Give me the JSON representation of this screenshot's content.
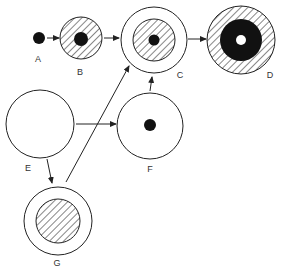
{
  "diagram": {
    "colors": {
      "stroke": "#222222",
      "fill_solid": "#111111",
      "background": "#ffffff"
    },
    "nodes": [
      {
        "id": "A",
        "label": "A",
        "description": "small solid black dot"
      },
      {
        "id": "B",
        "label": "B",
        "description": "hatched circle with solid black center dot"
      },
      {
        "id": "C",
        "label": "C",
        "description": "open ring around hatched disc with small black center dot"
      },
      {
        "id": "D",
        "label": "D",
        "description": "hatched outer ring, thick black ring, small white center"
      },
      {
        "id": "E",
        "label": "E",
        "description": "large empty circle"
      },
      {
        "id": "F",
        "label": "F",
        "description": "empty circle with solid black center dot"
      },
      {
        "id": "G",
        "label": "G",
        "description": "open ring around hatched disc"
      }
    ],
    "edges": [
      {
        "from": "A",
        "to": "B"
      },
      {
        "from": "B",
        "to": "C"
      },
      {
        "from": "C",
        "to": "D"
      },
      {
        "from": "E",
        "to": "F"
      },
      {
        "from": "E",
        "to": "G"
      },
      {
        "from": "G",
        "to": "C"
      },
      {
        "from": "F",
        "to": "C"
      }
    ]
  }
}
